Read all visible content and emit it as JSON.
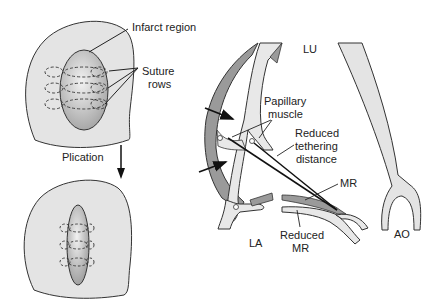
{
  "labels": {
    "infarct_region": "Infarct region",
    "suture_rows_line1": "Suture",
    "suture_rows_line2": "rows",
    "plication": "Plication",
    "lu": "LU",
    "papillary_line1": "Papillary",
    "papillary_line2": "muscle",
    "reduced_tethering_line1": "Reduced",
    "reduced_tethering_line2": "tethering",
    "reduced_tethering_line3": "distance",
    "mr": "MR",
    "reduced_mr_line1": "Reduced",
    "reduced_mr_line2": "MR",
    "la": "LA",
    "ao": "AO"
  },
  "colors": {
    "ventricle_fill": "#e4e4e4",
    "infarct_fill": "#c8c8c8",
    "wall_dark": "#9a9a9a",
    "wall_light": "#e8e8e8",
    "stroke": "#222222"
  }
}
